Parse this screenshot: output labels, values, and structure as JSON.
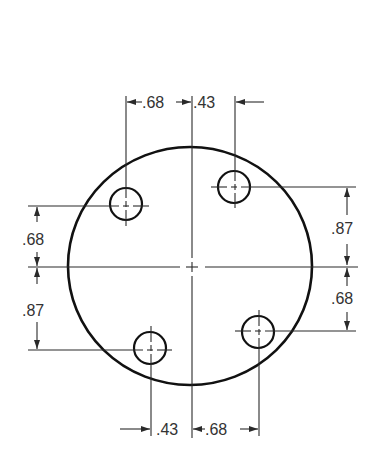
{
  "drawing": {
    "title": "",
    "units": "in",
    "bolt_circle": {
      "holes": [
        {
          "id": "upper-left",
          "x_from_center": -0.68,
          "y_from_center": 0.68
        },
        {
          "id": "upper-right",
          "x_from_center": 0.43,
          "y_from_center": 0.87
        },
        {
          "id": "lower-left",
          "x_from_center": -0.43,
          "y_from_center": -0.87
        },
        {
          "id": "lower-right",
          "x_from_center": 0.68,
          "y_from_center": -0.68
        }
      ]
    },
    "dimensions": {
      "top_left": ".68",
      "top_right": ".43",
      "bottom_left": ".43",
      "bottom_right": ".68",
      "left_upper": ".68",
      "left_lower": ".87",
      "right_upper": ".87",
      "right_lower": ".68"
    },
    "colors": {
      "line": "#111111",
      "text": "#333333",
      "background": "#ffffff"
    }
  }
}
